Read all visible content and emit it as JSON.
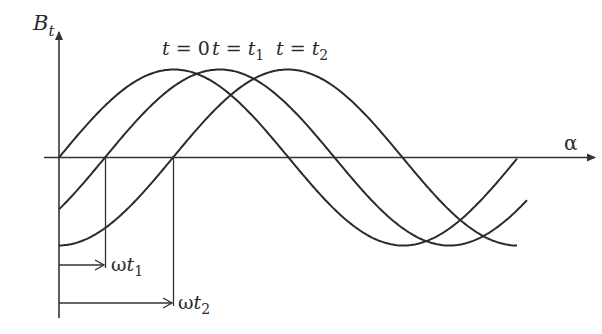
{
  "figure": {
    "type": "diagram",
    "axes": {
      "y_label": "B",
      "y_label_sub": "t",
      "x_label": "α"
    },
    "curves": [
      {
        "label_prefix": "t = ",
        "label_value": "0",
        "label_sub": "",
        "phase_px": 0
      },
      {
        "label_prefix": "t = ",
        "label_value": "t",
        "label_sub": "1",
        "phase_px": 46
      },
      {
        "label_prefix": "t = ",
        "label_value": "t",
        "label_sub": "2",
        "phase_px": 114
      }
    ],
    "annotations": [
      {
        "symbol": "ω",
        "var": "t",
        "sub": "1"
      },
      {
        "symbol": "ω",
        "var": "t",
        "sub": "2"
      }
    ],
    "colors": {
      "stroke": "#2b2b2b",
      "background": "#ffffff"
    }
  }
}
